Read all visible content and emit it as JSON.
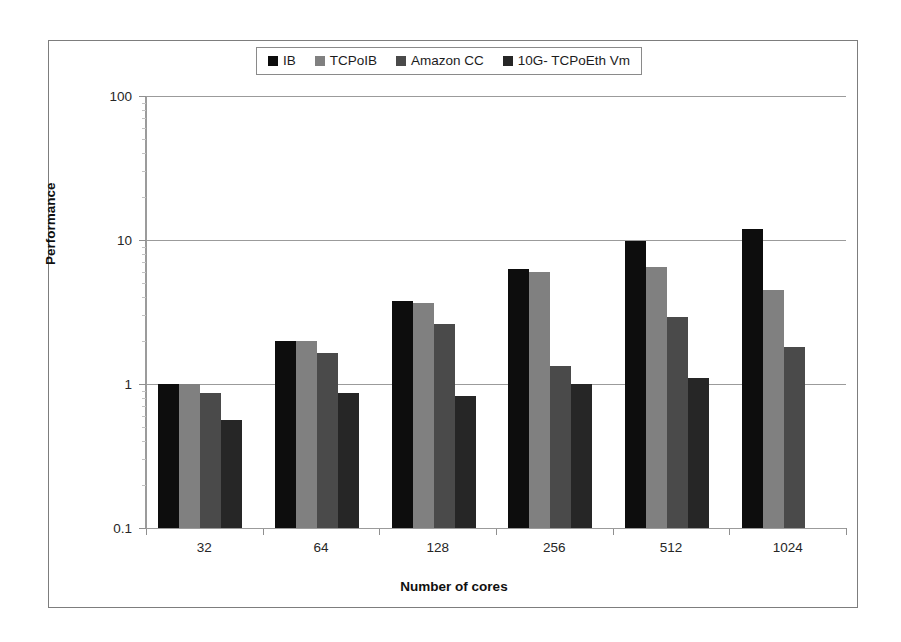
{
  "chart_data": {
    "type": "bar",
    "title": "",
    "xlabel": "Number of cores",
    "ylabel": "Performance",
    "categories": [
      "32",
      "64",
      "128",
      "256",
      "512",
      "1024"
    ],
    "yscale": "log",
    "ylim": [
      0.1,
      100
    ],
    "ytick_labels": [
      "0.1",
      "1",
      "10",
      "100"
    ],
    "ytick_values": [
      0.1,
      1,
      10,
      100
    ],
    "grid": true,
    "legend_position": "top-center",
    "series": [
      {
        "name": "IB",
        "color": "#0d0d0d",
        "values": [
          1.0,
          2.0,
          3.8,
          6.3,
          9.8,
          12.0
        ]
      },
      {
        "name": "TCPoIB",
        "color": "#808080",
        "values": [
          1.0,
          2.0,
          3.65,
          6.0,
          6.5,
          4.5
        ]
      },
      {
        "name": "Amazon CC",
        "color": "#4a4a4a",
        "values": [
          0.87,
          1.65,
          2.6,
          1.33,
          2.9,
          1.8
        ]
      },
      {
        "name": "10G- TCPoEth Vm",
        "color": "#262626",
        "values": [
          0.56,
          0.87,
          0.82,
          1.0,
          1.1,
          null
        ]
      }
    ]
  },
  "legend": {
    "entries": [
      {
        "label": "IB",
        "color": "#0d0d0d"
      },
      {
        "label": "TCPoIB",
        "color": "#808080"
      },
      {
        "label": "Amazon CC",
        "color": "#4a4a4a"
      },
      {
        "label": "10G- TCPoEth Vm",
        "color": "#262626"
      }
    ]
  },
  "axes": {
    "x_title": "Number of cores",
    "y_title": "Performance"
  }
}
